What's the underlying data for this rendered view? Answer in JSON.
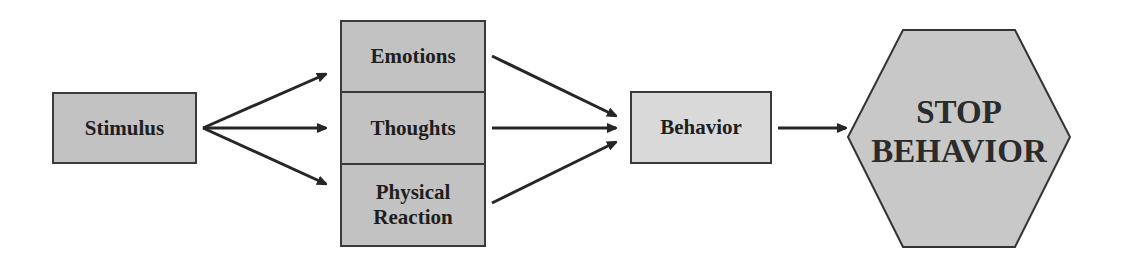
{
  "diagram": {
    "nodes": {
      "stimulus": "Stimulus",
      "emotions": "Emotions",
      "thoughts": "Thoughts",
      "physical_reaction_line1": "Physical",
      "physical_reaction_line2": "Reaction",
      "behavior": "Behavior",
      "stop_line1": "STOP",
      "stop_line2": "BEHAVIOR"
    },
    "edges": [
      {
        "from": "Stimulus",
        "to": "Emotions"
      },
      {
        "from": "Stimulus",
        "to": "Thoughts"
      },
      {
        "from": "Stimulus",
        "to": "Physical Reaction"
      },
      {
        "from": "Emotions",
        "to": "Behavior"
      },
      {
        "from": "Thoughts",
        "to": "Behavior"
      },
      {
        "from": "Physical Reaction",
        "to": "Behavior"
      },
      {
        "from": "Behavior",
        "to": "STOP BEHAVIOR"
      }
    ],
    "colors": {
      "box_fill": "#c2c2c2",
      "behavior_fill": "#d9d9d9",
      "stroke": "#3a3a3a",
      "text": "#1e1e1e"
    }
  }
}
